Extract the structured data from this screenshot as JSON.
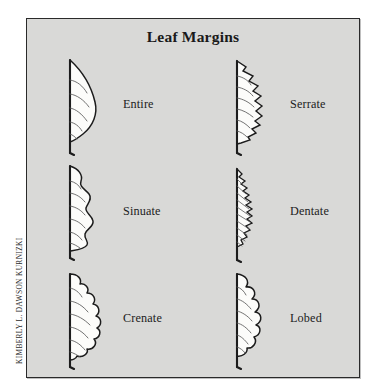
{
  "plate": {
    "title": "Leaf Margins",
    "credit": "Kimberly L. Dawson Kurnizki",
    "background_color": "#ffffff",
    "panel_color": "#d9d9d7",
    "border_color": "#2a2a2a",
    "ink_color": "#1c1c1c",
    "blade_fill": "#fcfcfa"
  },
  "diagram": {
    "type": "botanical-reference-plate",
    "columns": 2,
    "rows": 3,
    "figure_style": "half-leaf profile; straight midrib on left, margin outline on right, pinnate veins, short petiole at base",
    "items": [
      {
        "label": "Entire",
        "margin_type": "entire",
        "description": "smooth unbroken margin",
        "column": 0,
        "row": 0
      },
      {
        "label": "Serrate",
        "margin_type": "serrate",
        "description": "sharp forward-pointing sawtooth teeth",
        "column": 1,
        "row": 0
      },
      {
        "label": "Sinuate",
        "margin_type": "sinuate",
        "description": "wavy undulating margin",
        "column": 0,
        "row": 1
      },
      {
        "label": "Dentate",
        "margin_type": "dentate",
        "description": "many small outward-pointing teeth",
        "column": 1,
        "row": 1
      },
      {
        "label": "Crenate",
        "margin_type": "crenate",
        "description": "rounded scalloped teeth",
        "column": 0,
        "row": 2
      },
      {
        "label": "Lobed",
        "margin_type": "lobed",
        "description": "deep rounded indentations",
        "column": 1,
        "row": 2
      }
    ]
  }
}
